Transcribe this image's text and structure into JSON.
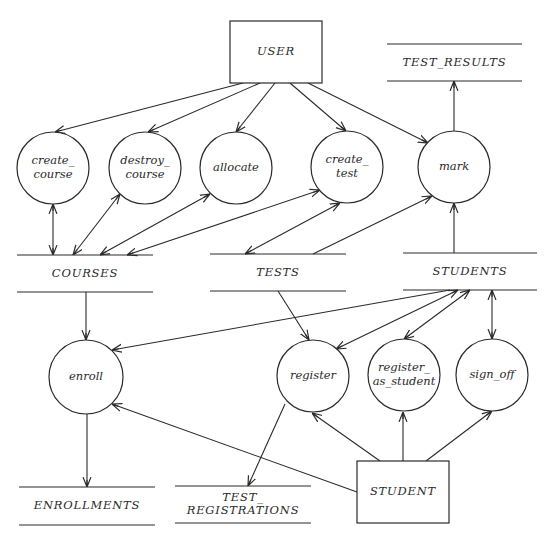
{
  "diagram": {
    "type": "data-flow-diagram",
    "external_entities": [
      {
        "id": "user",
        "label": "USER",
        "x": 230,
        "y": 21,
        "w": 92,
        "h": 62
      },
      {
        "id": "student",
        "label": "STUDENT",
        "x": 357,
        "y": 461,
        "w": 92,
        "h": 62
      }
    ],
    "processes": [
      {
        "id": "create_course",
        "lines": [
          "create_",
          "course"
        ],
        "cx": 53,
        "cy": 168,
        "r": 36
      },
      {
        "id": "destroy_course",
        "lines": [
          "destroy_",
          "course"
        ],
        "cx": 145,
        "cy": 168,
        "r": 36
      },
      {
        "id": "allocate",
        "lines": [
          "allocate"
        ],
        "cx": 236,
        "cy": 168,
        "r": 36
      },
      {
        "id": "create_test",
        "lines": [
          "create_",
          "test"
        ],
        "cx": 347,
        "cy": 167,
        "r": 36
      },
      {
        "id": "mark",
        "lines": [
          "mark"
        ],
        "cx": 454,
        "cy": 167,
        "r": 36
      },
      {
        "id": "enroll",
        "lines": [
          "enroll"
        ],
        "cx": 86,
        "cy": 377,
        "r": 37
      },
      {
        "id": "register",
        "lines": [
          "register"
        ],
        "cx": 313,
        "cy": 376,
        "r": 36
      },
      {
        "id": "register_as_student",
        "lines": [
          "register_",
          "as_student"
        ],
        "cx": 404,
        "cy": 375,
        "r": 36
      },
      {
        "id": "sign_off",
        "lines": [
          "sign_off"
        ],
        "cx": 492,
        "cy": 375,
        "r": 36
      }
    ],
    "data_stores": [
      {
        "id": "test_results",
        "lines": [
          "TEST_RESULTS"
        ],
        "x1": 387,
        "x2": 522,
        "top": 44,
        "bottom": 81
      },
      {
        "id": "courses",
        "lines": [
          "COURSES"
        ],
        "x1": 17,
        "x2": 153,
        "top": 255,
        "bottom": 292
      },
      {
        "id": "tests",
        "lines": [
          "TESTS"
        ],
        "x1": 210,
        "x2": 346,
        "top": 254,
        "bottom": 291
      },
      {
        "id": "students",
        "lines": [
          "STUDENTS"
        ],
        "x1": 403,
        "x2": 537,
        "top": 253,
        "bottom": 290
      },
      {
        "id": "enrollments",
        "lines": [
          "ENROLLMENTS"
        ],
        "x1": 19,
        "x2": 155,
        "top": 487,
        "bottom": 525
      },
      {
        "id": "test_registrations",
        "lines": [
          "TEST_",
          "REGISTRATIONS"
        ],
        "x1": 175,
        "x2": 311,
        "top": 486,
        "bottom": 523
      }
    ],
    "flows": [
      {
        "from": "USER",
        "to": "create_course",
        "x1": 243,
        "y1": 83,
        "x2": 55,
        "y2": 132,
        "end": true,
        "start": false
      },
      {
        "from": "USER",
        "to": "destroy_course",
        "x1": 260,
        "y1": 83,
        "x2": 148,
        "y2": 132,
        "end": true,
        "start": false
      },
      {
        "from": "USER",
        "to": "allocate",
        "x1": 275,
        "y1": 83,
        "x2": 236,
        "y2": 132,
        "end": true,
        "start": false
      },
      {
        "from": "USER",
        "to": "create_test",
        "x1": 290,
        "y1": 83,
        "x2": 346,
        "y2": 131,
        "end": true,
        "start": false
      },
      {
        "from": "USER",
        "to": "mark",
        "x1": 308,
        "y1": 83,
        "x2": 428,
        "y2": 143,
        "end": true,
        "start": false
      },
      {
        "from": "mark",
        "to": "TEST_RESULTS",
        "x1": 454,
        "y1": 131,
        "x2": 454,
        "y2": 81,
        "end": true,
        "start": false
      },
      {
        "from": "create_course",
        "to": "COURSES",
        "x1": 53,
        "y1": 204,
        "x2": 53,
        "y2": 255,
        "end": true,
        "start": true
      },
      {
        "from": "destroy_course",
        "to": "COURSES",
        "x1": 120,
        "y1": 194,
        "x2": 73,
        "y2": 255,
        "end": true,
        "start": true
      },
      {
        "from": "allocate",
        "to": "COURSES",
        "x1": 210,
        "y1": 194,
        "x2": 100,
        "y2": 255,
        "end": true,
        "start": true
      },
      {
        "from": "create_test",
        "to": "COURSES",
        "x1": 320,
        "y1": 190,
        "x2": 127,
        "y2": 255,
        "end": true,
        "start": true
      },
      {
        "from": "create_test",
        "to": "TESTS",
        "x1": 340,
        "y1": 203,
        "x2": 245,
        "y2": 254,
        "end": true,
        "start": true
      },
      {
        "from": "TESTS",
        "to": "mark",
        "x1": 313,
        "y1": 254,
        "x2": 432,
        "y2": 196,
        "end": true,
        "start": false
      },
      {
        "from": "STUDENTS",
        "to": "mark",
        "x1": 454,
        "y1": 253,
        "x2": 454,
        "y2": 203,
        "end": true,
        "start": false
      },
      {
        "from": "COURSES",
        "to": "enroll",
        "x1": 86,
        "y1": 292,
        "x2": 86,
        "y2": 340,
        "end": true,
        "start": false
      },
      {
        "from": "STUDENTS",
        "to": "enroll",
        "x1": 450,
        "y1": 290,
        "x2": 112,
        "y2": 350,
        "end": true,
        "start": false
      },
      {
        "from": "TESTS",
        "to": "register",
        "x1": 278,
        "y1": 291,
        "x2": 309,
        "y2": 340,
        "end": true,
        "start": false
      },
      {
        "from": "register",
        "to": "STUDENTS",
        "x1": 336,
        "y1": 349,
        "x2": 458,
        "y2": 290,
        "end": true,
        "start": true
      },
      {
        "from": "register_as_student",
        "to": "STUDENTS",
        "x1": 404,
        "y1": 339,
        "x2": 470,
        "y2": 290,
        "end": true,
        "start": true
      },
      {
        "from": "sign_off",
        "to": "STUDENTS",
        "x1": 492,
        "y1": 339,
        "x2": 492,
        "y2": 290,
        "end": true,
        "start": true
      },
      {
        "from": "enroll",
        "to": "ENROLLMENTS",
        "x1": 87,
        "y1": 414,
        "x2": 87,
        "y2": 487,
        "end": true,
        "start": false
      },
      {
        "from": "register",
        "to": "TEST_REGISTRATIONS",
        "x1": 285,
        "y1": 404,
        "x2": 248,
        "y2": 486,
        "end": true,
        "start": false
      },
      {
        "from": "STUDENT",
        "to": "enroll",
        "x1": 357,
        "y1": 492,
        "x2": 112,
        "y2": 404,
        "end": true,
        "start": false
      },
      {
        "from": "STUDENT",
        "to": "register",
        "x1": 380,
        "y1": 461,
        "x2": 312,
        "y2": 413,
        "end": true,
        "start": false
      },
      {
        "from": "STUDENT",
        "to": "register_as_student",
        "x1": 403,
        "y1": 461,
        "x2": 403,
        "y2": 412,
        "end": true,
        "start": false
      },
      {
        "from": "STUDENT",
        "to": "sign_off",
        "x1": 426,
        "y1": 461,
        "x2": 492,
        "y2": 411,
        "end": true,
        "start": false
      }
    ]
  }
}
